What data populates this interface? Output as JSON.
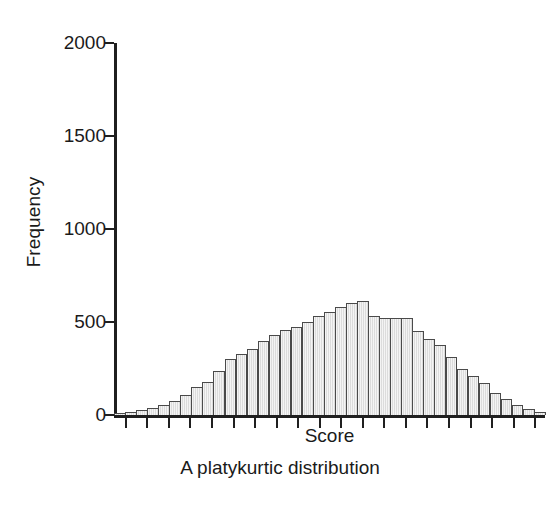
{
  "chart_data": {
    "type": "bar",
    "title": "",
    "caption": "A platykurtic distribution",
    "xlabel": "Score",
    "ylabel": "Frequency",
    "ylim": [
      0,
      2000
    ],
    "yticks": [
      0,
      500,
      1000,
      1500,
      2000
    ],
    "ytick_labels": [
      "0",
      "500",
      "1000",
      "1500",
      "2000"
    ],
    "grid": false,
    "legend": false,
    "bar_fill_color": "#e6e6e6",
    "bar_edge_color": "#4a4a4a",
    "axis_color": "#1f1f1f",
    "background_color": "#ffffff",
    "n_bins": 39,
    "n_xticks": 20,
    "categories": [
      "b1",
      "b2",
      "b3",
      "b4",
      "b5",
      "b6",
      "b7",
      "b8",
      "b9",
      "b10",
      "b11",
      "b12",
      "b13",
      "b14",
      "b15",
      "b16",
      "b17",
      "b18",
      "b19",
      "b20",
      "b21",
      "b22",
      "b23",
      "b24",
      "b25",
      "b26",
      "b27",
      "b28",
      "b29",
      "b30",
      "b31",
      "b32",
      "b33",
      "b34",
      "b35",
      "b36",
      "b37",
      "b38",
      "b39"
    ],
    "values": [
      10,
      18,
      28,
      40,
      55,
      78,
      110,
      150,
      175,
      235,
      300,
      330,
      355,
      400,
      430,
      455,
      475,
      500,
      530,
      555,
      580,
      600,
      615,
      530,
      520,
      520,
      520,
      450,
      410,
      375,
      310,
      250,
      210,
      170,
      120,
      85,
      55,
      30,
      14
    ]
  }
}
